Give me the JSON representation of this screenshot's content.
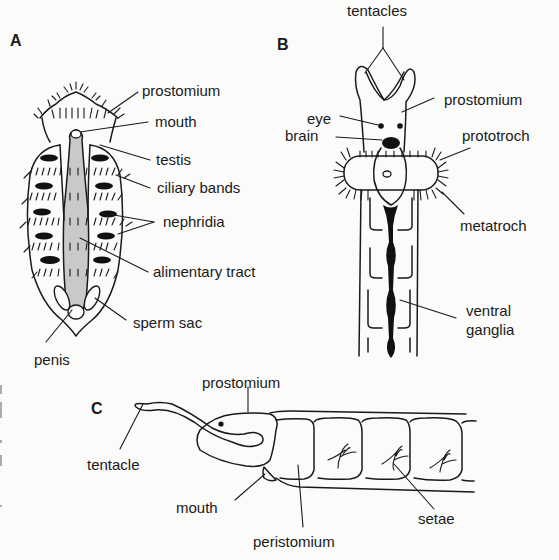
{
  "figure": {
    "panels": [
      {
        "id": "A",
        "label": "A",
        "annotations": [
          "prostomium",
          "mouth",
          "testis",
          "ciliary bands",
          "nephridia",
          "alimentary tract",
          "sperm sac",
          "penis"
        ]
      },
      {
        "id": "B",
        "label": "B",
        "annotations": [
          "tentacles",
          "eye",
          "prostomium",
          "brain",
          "prototroch",
          "metatroch",
          "ventral",
          "ganglia"
        ]
      },
      {
        "id": "C",
        "label": "C",
        "annotations": [
          "prostomium",
          "tentacle",
          "mouth",
          "peristomium",
          "setae"
        ]
      }
    ],
    "colors": {
      "background": "#fbfbfa",
      "ink": "#1a1a1a",
      "gut_fill": "#c9c9c9"
    }
  }
}
